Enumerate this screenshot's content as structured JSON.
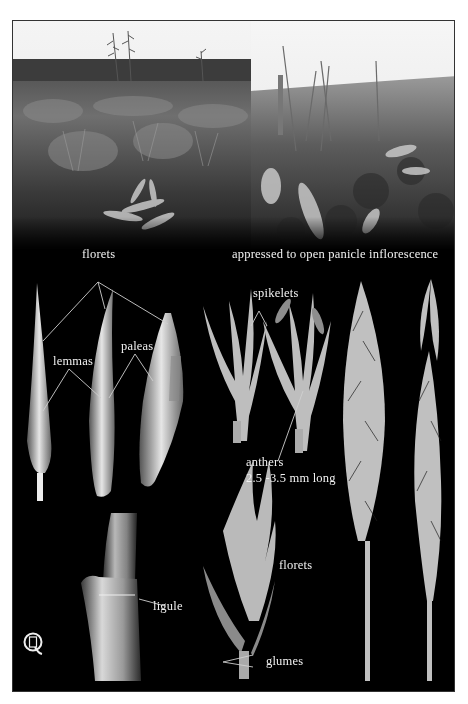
{
  "plate": {
    "photos": [
      {
        "name": "habitat-photo-left",
        "description": "grassland habitat with grass panicles against sky"
      },
      {
        "name": "habitat-photo-right",
        "description": "close-up of prairie vegetation with grass stems"
      }
    ],
    "labels": {
      "florets_top": "florets",
      "inflorescence": "appressed to open panicle inflorescence",
      "lemmas": "lemmas",
      "paleas": "paleas",
      "spikelets": "spikelets",
      "anthers": "anthers",
      "anthers_size": "2.5 -3.5 mm long",
      "florets_bottom": "florets",
      "glumes": "glumes",
      "ligule": "ligule"
    },
    "logo": {
      "icon": "qs-monogram-logo",
      "text": "QS"
    },
    "colors": {
      "background": "#000000",
      "page": "#ffffff",
      "label": "#f2f2f2",
      "leader_line": "#cfcfcf",
      "specimen": "#d8d8d8"
    }
  }
}
